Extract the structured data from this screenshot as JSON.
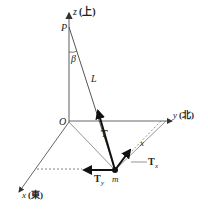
{
  "diagram": {
    "axes": {
      "z_label": "z",
      "z_dir": "(上)",
      "y_label": "y",
      "y_dir": "(北)",
      "x_label": "x",
      "x_dir": "(東)",
      "origin": "O"
    },
    "points": {
      "pivot": "P",
      "mass": "m"
    },
    "labels": {
      "angle": "β",
      "length": "L",
      "tension": "T",
      "tension_x": "T",
      "tension_x_sub": "x",
      "tension_y": "T",
      "tension_y_sub": "y",
      "x_projection": "x"
    },
    "colors": {
      "line": "#666666",
      "arrow": "#1a1a1a",
      "text": "#222222"
    }
  }
}
